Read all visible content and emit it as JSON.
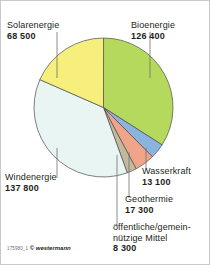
{
  "credit": {
    "code": "175980_1",
    "copyright": "© westermann"
  },
  "chart_data": {
    "type": "pie",
    "title": "",
    "unit": "",
    "total": 371400,
    "start_angle_deg": 0,
    "direction": "clockwise",
    "grid": false,
    "legend": "callout-labels",
    "categories": [
      "Bioenergie",
      "Wasserkraft",
      "Geothermie",
      "öffentliche/gemein-\nnützige Mittel",
      "Windenergie",
      "Solarenergie"
    ],
    "values": [
      126400,
      13100,
      17300,
      8300,
      137800,
      68500
    ],
    "value_labels": [
      "126 400",
      "13 100",
      "17 300",
      "8 300",
      "137 800",
      "68 500"
    ],
    "colors": [
      "#b5d95c",
      "#8ab4dd",
      "#f0a58a",
      "#c3ba9d",
      "#e8f5f3",
      "#f6ef7c"
    ],
    "slices": [
      {
        "name": "Bioenergie",
        "value": 126400,
        "label": "126 400",
        "color": "#b5d95c",
        "start": 0.0,
        "sweep": 122.52
      },
      {
        "name": "Wasserkraft",
        "value": 13100,
        "label": "13 100",
        "color": "#8ab4dd",
        "start": 122.52,
        "sweep": 12.7
      },
      {
        "name": "Geothermie",
        "value": 17300,
        "label": "17 300",
        "color": "#f0a58a",
        "start": 135.22,
        "sweep": 16.77
      },
      {
        "name": "öffentliche Mittel",
        "value": 8300,
        "label": "8 300",
        "color": "#c3ba9d",
        "start": 151.99,
        "sweep": 8.05
      },
      {
        "name": "Windenergie",
        "value": 137800,
        "label": "137 800",
        "color": "#e8f5f3",
        "start": 160.04,
        "sweep": 133.59
      },
      {
        "name": "Solarenergie",
        "value": 68500,
        "label": "68 500",
        "color": "#f6ef7c",
        "start": 293.63,
        "sweep": 66.41
      }
    ]
  },
  "labels": {
    "solar": {
      "name": "Solarenergie",
      "value": "68 500"
    },
    "bio": {
      "name": "Bioenergie",
      "value": "126 400"
    },
    "wind": {
      "name": "Windenergie",
      "value": "137 800"
    },
    "wasser": {
      "name": "Wasserkraft",
      "value": "13 100"
    },
    "geo": {
      "name": "Geothermie",
      "value": "17 300"
    },
    "oeff": {
      "name": "öffentliche/gemein-nützige Mittel",
      "value": "8 300"
    }
  }
}
